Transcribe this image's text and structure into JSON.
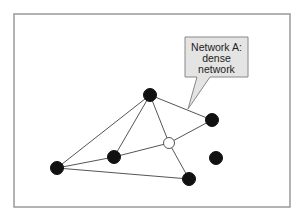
{
  "diagram": {
    "frame": {
      "x": 14,
      "y": 14,
      "width": 276,
      "height": 193,
      "stroke": "#999999"
    },
    "callout": {
      "lines": [
        "Network A:",
        "dense",
        "network"
      ],
      "box": {
        "x": 185,
        "y": 37,
        "width": 63,
        "height": 40
      },
      "tip": {
        "x": 188,
        "y": 109
      },
      "fill": "#e4e4e4",
      "stroke": "#888888"
    },
    "nodes": [
      {
        "id": "top",
        "x": 150,
        "y": 95,
        "filled": true
      },
      {
        "id": "right",
        "x": 212,
        "y": 120,
        "filled": true
      },
      {
        "id": "center",
        "x": 169,
        "y": 143,
        "filled": false
      },
      {
        "id": "left-mid",
        "x": 114,
        "y": 157,
        "filled": true
      },
      {
        "id": "far-left",
        "x": 57,
        "y": 168,
        "filled": true
      },
      {
        "id": "bottom",
        "x": 189,
        "y": 179,
        "filled": true
      },
      {
        "id": "isolated",
        "x": 216,
        "y": 158,
        "filled": true
      }
    ],
    "edges": [
      [
        "top",
        "right"
      ],
      [
        "top",
        "far-left"
      ],
      [
        "top",
        "left-mid"
      ],
      [
        "top",
        "center"
      ],
      [
        "right",
        "center"
      ],
      [
        "center",
        "left-mid"
      ],
      [
        "center",
        "bottom"
      ],
      [
        "left-mid",
        "far-left"
      ],
      [
        "far-left",
        "bottom"
      ]
    ],
    "colors": {
      "node": "#111111",
      "edge": "#555555",
      "open_node_fill": "#ffffff"
    }
  }
}
